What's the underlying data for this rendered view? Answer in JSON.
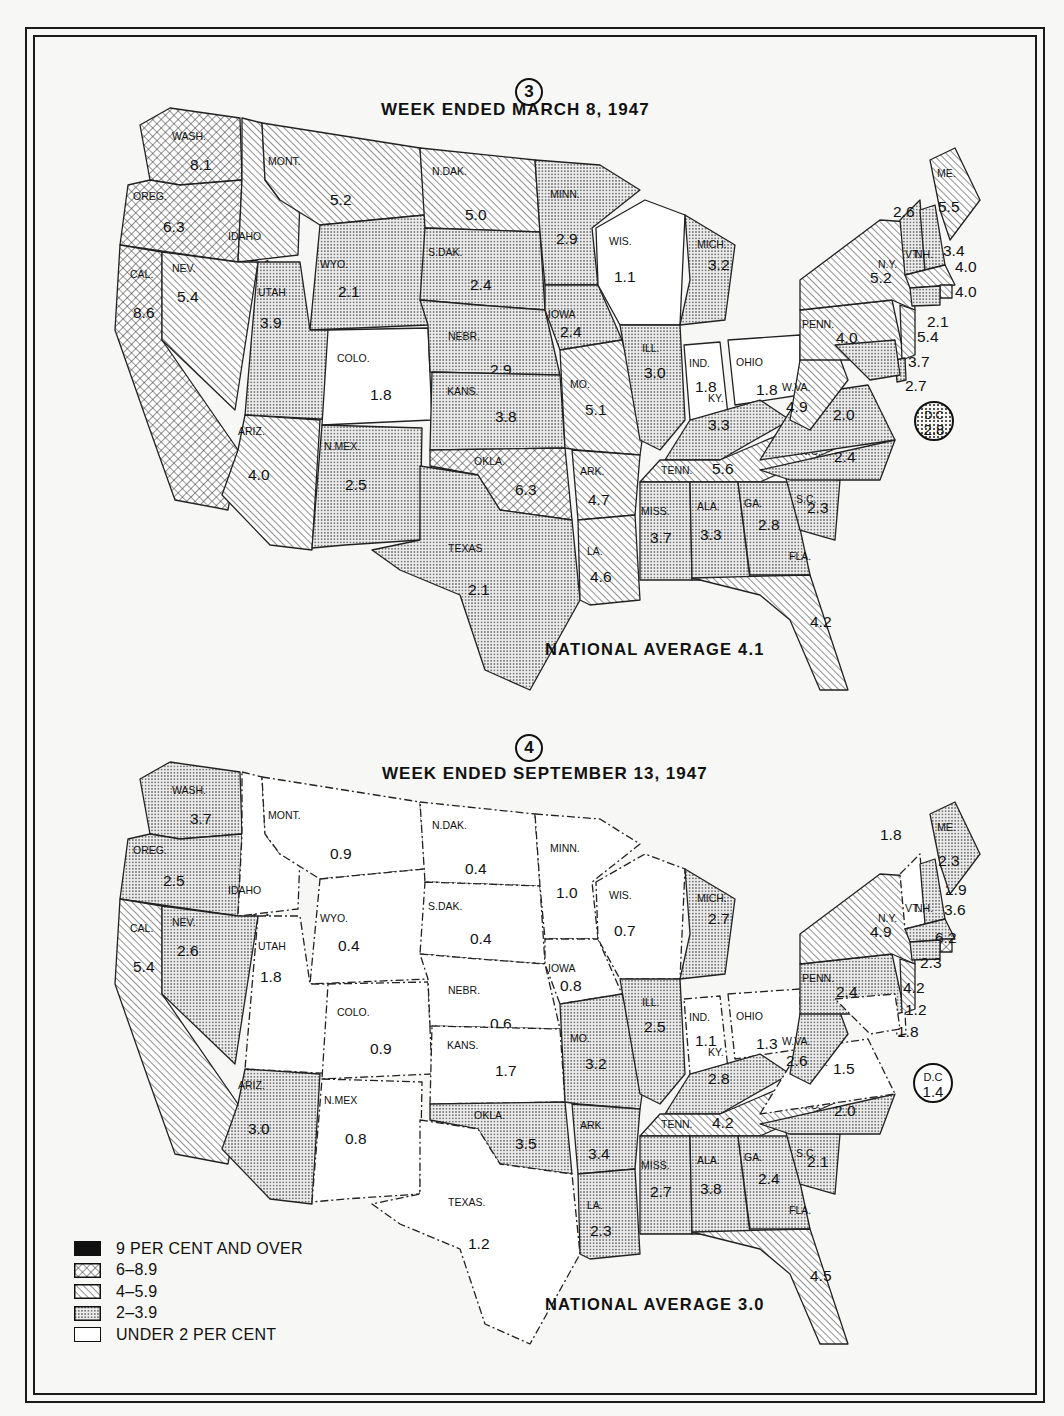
{
  "legend": {
    "items": [
      {
        "key": "9plus",
        "label": "9 PER CENT AND OVER",
        "pattern": "solid-black"
      },
      {
        "key": "6to8",
        "label": "6–8.9",
        "pattern": "crosshatch"
      },
      {
        "key": "4to5",
        "label": "4–5.9",
        "pattern": "diagonal-hatch"
      },
      {
        "key": "2to3",
        "label": "2–3.9",
        "pattern": "stipple"
      },
      {
        "key": "under2",
        "label": "UNDER 2 PER CENT",
        "pattern": "blank"
      }
    ]
  },
  "maps": [
    {
      "number": "3",
      "title": "WEEK ENDED MARCH 8, 1947",
      "national_average": "NATIONAL AVERAGE 4.1",
      "dc": {
        "label": "D.C",
        "value": "2.8"
      },
      "states": {
        "WA": {
          "label": "WASH.",
          "value": "8.1"
        },
        "OR": {
          "label": "OREG.",
          "value": "6.3"
        },
        "CA": {
          "label": "CAL.",
          "value": "8.6"
        },
        "ID": {
          "label": "IDAHO",
          "value": "5.1"
        },
        "NV": {
          "label": "NEV.",
          "value": "5.4"
        },
        "MT": {
          "label": "MONT.",
          "value": "5.2"
        },
        "WY": {
          "label": "WYO.",
          "value": "2.1"
        },
        "UT": {
          "label": "UTAH",
          "value": "3.9"
        },
        "AZ": {
          "label": "ARIZ.",
          "value": "4.0"
        },
        "CO": {
          "label": "COLO.",
          "value": "1.8"
        },
        "NM": {
          "label": "N.MEX.",
          "value": "2.5"
        },
        "ND": {
          "label": "N.DAK.",
          "value": "5.0"
        },
        "SD": {
          "label": "S.DAK.",
          "value": "2.4"
        },
        "NE": {
          "label": "NEBR.",
          "value": "2.9"
        },
        "KS": {
          "label": "KANS.",
          "value": "3.8"
        },
        "OK": {
          "label": "OKLA.",
          "value": "6.3"
        },
        "TX": {
          "label": "TEXAS",
          "value": "2.1"
        },
        "MN": {
          "label": "MINN.",
          "value": "2.9"
        },
        "IA": {
          "label": "IOWA",
          "value": "2.4"
        },
        "MO": {
          "label": "MO.",
          "value": "5.1"
        },
        "AR": {
          "label": "ARK.",
          "value": "4.7"
        },
        "LA": {
          "label": "LA.",
          "value": "4.6"
        },
        "WI": {
          "label": "WIS.",
          "value": "1.1"
        },
        "IL": {
          "label": "ILL.",
          "value": "3.0"
        },
        "MI": {
          "label": "MICH.",
          "value": "3.2"
        },
        "IN": {
          "label": "IND.",
          "value": "1.8"
        },
        "OH": {
          "label": "OHIO",
          "value": "1.8"
        },
        "KY": {
          "label": "KY.",
          "value": "3.3"
        },
        "TN": {
          "label": "TENN.",
          "value": "5.6"
        },
        "MS": {
          "label": "MISS.",
          "value": "3.7"
        },
        "AL": {
          "label": "ALA.",
          "value": "3.3"
        },
        "GA": {
          "label": "GA.",
          "value": "2.8"
        },
        "FL": {
          "label": "FLA.",
          "value": "4.2"
        },
        "SC": {
          "label": "S.C.",
          "value": "2.3"
        },
        "NC": {
          "label": "N.C.",
          "value": "2.4"
        },
        "VA": {
          "label": "VA.",
          "value": "2.0"
        },
        "WV": {
          "label": "W.VA.",
          "value": "4.9"
        },
        "PA": {
          "label": "PENN.",
          "value": "4.0"
        },
        "NY": {
          "label": "N.Y.",
          "value": "5.2"
        },
        "VT": {
          "label": "VT.",
          "value": "2.6"
        },
        "NH": {
          "label": "NH.",
          "value": "3.4"
        },
        "ME": {
          "label": "ME.",
          "value": "5.5"
        },
        "MA": {
          "label": "",
          "value": "4.0"
        },
        "RI": {
          "label": "",
          "value": "4.0"
        },
        "CT": {
          "label": "",
          "value": "2.1"
        },
        "NJ": {
          "label": "",
          "value": "5.4"
        },
        "DE": {
          "label": "",
          "value": "3.7"
        },
        "MD": {
          "label": "",
          "value": "2.7"
        }
      }
    },
    {
      "number": "4",
      "title": "WEEK ENDED SEPTEMBER 13, 1947",
      "national_average": "NATIONAL AVERAGE 3.0",
      "dc": {
        "label": "D.C",
        "value": "1.4"
      },
      "states": {
        "WA": {
          "label": "WASH.",
          "value": "3.7"
        },
        "OR": {
          "label": "OREG.",
          "value": "2.5"
        },
        "CA": {
          "label": "CAL.",
          "value": "5.4"
        },
        "ID": {
          "label": "IDAHO",
          "value": "1.1"
        },
        "NV": {
          "label": "NEV.",
          "value": "2.6"
        },
        "MT": {
          "label": "MONT.",
          "value": "0.9"
        },
        "WY": {
          "label": "WYO.",
          "value": "0.4"
        },
        "UT": {
          "label": "UTAH",
          "value": "1.8"
        },
        "AZ": {
          "label": "ARIZ.",
          "value": "3.0"
        },
        "CO": {
          "label": "COLO.",
          "value": "0.9"
        },
        "NM": {
          "label": "N.MEX",
          "value": "0.8"
        },
        "ND": {
          "label": "N.DAK.",
          "value": "0.4"
        },
        "SD": {
          "label": "S.DAK.",
          "value": "0.4"
        },
        "NE": {
          "label": "NEBR.",
          "value": "0.6"
        },
        "KS": {
          "label": "KANS.",
          "value": "1.7"
        },
        "OK": {
          "label": "OKLA.",
          "value": "3.5"
        },
        "TX": {
          "label": "TEXAS.",
          "value": "1.2"
        },
        "MN": {
          "label": "MINN.",
          "value": "1.0"
        },
        "IA": {
          "label": "IOWA",
          "value": "0.8"
        },
        "MO": {
          "label": "MO.",
          "value": "3.2"
        },
        "AR": {
          "label": "ARK.",
          "value": "3.4"
        },
        "LA": {
          "label": "LA.",
          "value": "2.3"
        },
        "WI": {
          "label": "WIS.",
          "value": "0.7"
        },
        "IL": {
          "label": "ILL.",
          "value": "2.5"
        },
        "MI": {
          "label": "MICH.",
          "value": "2.7"
        },
        "IN": {
          "label": "IND.",
          "value": "1.1"
        },
        "OH": {
          "label": "OHIO",
          "value": "1.3"
        },
        "KY": {
          "label": "KY.",
          "value": "2.8"
        },
        "TN": {
          "label": "TENN.",
          "value": "4.2"
        },
        "MS": {
          "label": "MISS.",
          "value": "2.7"
        },
        "AL": {
          "label": "ALA.",
          "value": "3.8"
        },
        "GA": {
          "label": "GA.",
          "value": "2.4"
        },
        "FL": {
          "label": "FLA.",
          "value": "4.5"
        },
        "SC": {
          "label": "S.C.",
          "value": "2.1"
        },
        "NC": {
          "label": "N.C.",
          "value": "2.0"
        },
        "VA": {
          "label": "VA.",
          "value": "1.5"
        },
        "WV": {
          "label": "W.VA.",
          "value": "2.6"
        },
        "PA": {
          "label": "PENN.",
          "value": "2.4"
        },
        "NY": {
          "label": "N.Y.",
          "value": "4.9"
        },
        "VT": {
          "label": "VT.",
          "value": "1.8"
        },
        "NH": {
          "label": "NH.",
          "value": "2.9"
        },
        "ME": {
          "label": "ME.",
          "value": "2.3"
        },
        "MA": {
          "label": "",
          "value": "3.6"
        },
        "RI": {
          "label": "",
          "value": "6.2"
        },
        "CT": {
          "label": "",
          "value": "2.3"
        },
        "NJ": {
          "label": "",
          "value": "4.2"
        },
        "DE": {
          "label": "",
          "value": "1.2"
        },
        "MD": {
          "label": "",
          "value": "1.8"
        }
      }
    }
  ]
}
